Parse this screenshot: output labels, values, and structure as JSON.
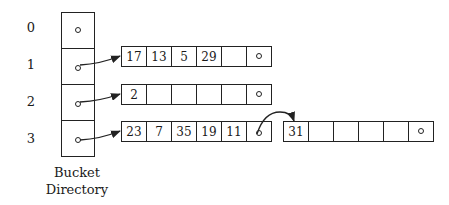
{
  "row_labels": [
    "0",
    "1",
    "2",
    "3"
  ],
  "caption": {
    "line1": "Bucket",
    "line2": "Directory"
  },
  "buckets": [
    {
      "name": "bucket-1",
      "slots": [
        "17",
        "13",
        "5",
        "29",
        "",
        ""
      ]
    },
    {
      "name": "bucket-2",
      "slots": [
        "2",
        "",
        "",
        "",
        "",
        ""
      ]
    },
    {
      "name": "bucket-3",
      "slots": [
        "23",
        "7",
        "35",
        "19",
        "11",
        ""
      ]
    },
    {
      "name": "overflow-bucket",
      "slots": [
        "31",
        "",
        "",
        "",
        "",
        ""
      ]
    }
  ]
}
